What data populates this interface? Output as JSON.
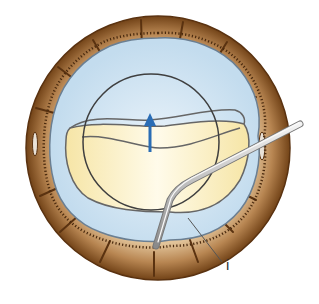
{
  "figure": {
    "type": "surgical-illustration",
    "labels": [
      {
        "id": "i",
        "text": "i",
        "x": 228,
        "y": 262
      }
    ],
    "arrow": {
      "direction": "up",
      "color": "#2a6db5"
    },
    "colors": {
      "iris_outer": "#7a4a1e",
      "iris_mid": "#b5834f",
      "iris_inner": "#d9b88c",
      "capsule_bg": "#cfe3f2",
      "lens_nucleus": "#fbf1c8",
      "outline": "#555555",
      "instrument": "#c9c9c9",
      "arrow": "#2a6db5"
    }
  }
}
